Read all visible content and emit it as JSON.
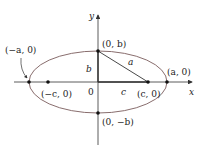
{
  "diagram": {
    "type": "ellipse-foci",
    "colors": {
      "axis": "#333333",
      "ellipse": "#7a5c5c",
      "segment": "#333333",
      "point": "#111111",
      "text": "#222222"
    },
    "axes": {
      "x_label": "x",
      "y_label": "y",
      "origin_label": "0"
    },
    "points": [
      {
        "id": "vertex-left",
        "label": "(−a, 0)"
      },
      {
        "id": "focus-left",
        "label": "(−c, 0)"
      },
      {
        "id": "co-vertex-top",
        "label": "(0, b)"
      },
      {
        "id": "focus-right",
        "label": "(c, 0)"
      },
      {
        "id": "vertex-right",
        "label": "(a, 0)"
      },
      {
        "id": "co-vertex-bottom",
        "label": "(0, −b)"
      }
    ],
    "segment_labels": {
      "hypotenuse": "a",
      "vertical": "b",
      "horizontal": "c"
    }
  }
}
